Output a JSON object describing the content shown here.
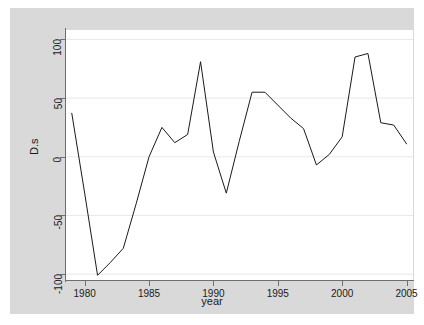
{
  "chart_data": {
    "type": "line",
    "title": "",
    "subtitle": "",
    "xlabel": "year",
    "ylabel": "D.s",
    "xlim": [
      1978.55,
      2005.5
    ],
    "ylim": [
      -105,
      108
    ],
    "xticks": [
      1980,
      1985,
      1990,
      1995,
      2000,
      2005
    ],
    "xtick_labels": [
      "1980",
      "1985",
      "1990",
      "1995",
      "2000",
      "2005"
    ],
    "yticks": [
      100,
      50,
      0,
      -50,
      -100
    ],
    "ytick_labels": [
      "100",
      "50",
      "0",
      "-50",
      "-100"
    ],
    "grid": "horizontal",
    "grid_color": "#e8e8e8",
    "legend": "none",
    "line_color": "#1a1a1a",
    "line_width": 1,
    "plot_bg": "#ffffff",
    "graph_bg": "#d9d9d9",
    "axis_color": "#6e6e6e",
    "series": [
      {
        "name": "D.s",
        "x": [
          1979,
          1980,
          1981,
          1982,
          1983,
          1984,
          1985,
          1986,
          1987,
          1988,
          1989,
          1990,
          1991,
          1992,
          1993,
          1994,
          1995,
          1996,
          1997,
          1998,
          1999,
          2000,
          2001,
          2002,
          2003,
          2004,
          2005
        ],
        "values": [
          37,
          -31,
          -101,
          -90,
          -78,
          -40,
          0,
          25,
          12,
          19,
          81,
          4,
          -31,
          13,
          55,
          55,
          44,
          33,
          24,
          -7,
          2,
          17,
          85,
          88,
          29,
          27,
          11
        ]
      }
    ]
  }
}
